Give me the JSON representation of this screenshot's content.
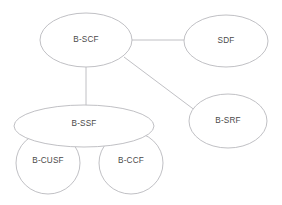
{
  "diagram": {
    "type": "node-link-ellipse-diagram",
    "canvas": {
      "width": 282,
      "height": 205,
      "background": "#ffffff"
    },
    "style": {
      "node_stroke": "#b9b9bd",
      "node_fill": "#ffffff",
      "edge_stroke": "#b9b9bd",
      "label_color": "#4a4a4a"
    },
    "nodes": [
      {
        "id": "b-scf",
        "label": "B-SCF",
        "shape": "ellipse",
        "cx": 86,
        "cy": 40,
        "rx": 46,
        "ry": 27,
        "label_x": 86,
        "label_y": 40
      },
      {
        "id": "sdf",
        "label": "SDF",
        "shape": "ellipse",
        "cx": 226,
        "cy": 41,
        "rx": 42,
        "ry": 26,
        "label_x": 226,
        "label_y": 41
      },
      {
        "id": "b-srf",
        "label": "B-SRF",
        "shape": "ellipse",
        "cx": 228,
        "cy": 121,
        "rx": 39,
        "ry": 27,
        "label_x": 228,
        "label_y": 121
      },
      {
        "id": "b-ssf",
        "label": "B-SSF",
        "shape": "ellipse",
        "cx": 84,
        "cy": 126,
        "rx": 70,
        "ry": 21,
        "label_x": 84,
        "label_y": 124
      },
      {
        "id": "b-cusf",
        "label": "B-CUSF",
        "shape": "ellipse",
        "cx": 48,
        "cy": 163,
        "rx": 32,
        "ry": 31,
        "label_x": 48,
        "label_y": 161
      },
      {
        "id": "b-ccf",
        "label": "B-CCF",
        "shape": "ellipse",
        "cx": 131,
        "cy": 163,
        "rx": 32,
        "ry": 31,
        "label_x": 131,
        "label_y": 161
      }
    ],
    "edges": [
      {
        "id": "edge-bscf-sdf",
        "from": "b-scf",
        "to": "sdf",
        "x1": 132,
        "y1": 40,
        "x2": 184,
        "y2": 40
      },
      {
        "id": "edge-bscf-bssf",
        "from": "b-scf",
        "to": "b-ssf",
        "x1": 86,
        "y1": 67,
        "x2": 86,
        "y2": 107
      },
      {
        "id": "edge-bscf-bsrf",
        "from": "b-scf",
        "to": "b-srf",
        "x1": 124,
        "y1": 57,
        "x2": 196,
        "y2": 111
      }
    ]
  }
}
